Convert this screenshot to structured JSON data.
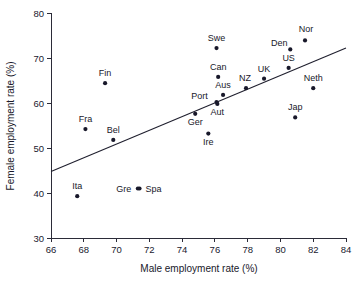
{
  "chart_data": {
    "type": "scatter",
    "title": "",
    "xlabel": "Male employment rate (%)",
    "ylabel": "Female employment rate (%)",
    "xlim": [
      66,
      84
    ],
    "ylim": [
      30,
      80
    ],
    "xticks": [
      66,
      68,
      70,
      72,
      74,
      76,
      78,
      80,
      82,
      84
    ],
    "yticks": [
      30,
      40,
      50,
      60,
      70,
      80
    ],
    "grid": false,
    "legend": null,
    "marker_color": "#18182a",
    "line_color": "#1f1f2e",
    "points": [
      {
        "label": "Ita",
        "x": 67.6,
        "y": 39.3,
        "label_dx": 0,
        "label_dy": -7
      },
      {
        "label": "Fra",
        "x": 68.1,
        "y": 54.2,
        "label_dx": 0,
        "label_dy": -7
      },
      {
        "label": "Fin",
        "x": 69.3,
        "y": 64.4,
        "label_dx": 0,
        "label_dy": -7
      },
      {
        "label": "Bel",
        "x": 69.8,
        "y": 51.8,
        "label_dx": 0,
        "label_dy": -7
      },
      {
        "label": "Gre",
        "x": 71.3,
        "y": 41.0,
        "label_dx": -14,
        "label_dy": 3
      },
      {
        "label": "Spa",
        "x": 71.4,
        "y": 41.0,
        "label_dx": 14,
        "label_dy": 3
      },
      {
        "label": "Ger",
        "x": 74.8,
        "y": 57.6,
        "label_dx": 0,
        "label_dy": 11
      },
      {
        "label": "Ire",
        "x": 75.6,
        "y": 53.2,
        "label_dx": 0,
        "label_dy": 11
      },
      {
        "label": "Swe",
        "x": 76.1,
        "y": 72.2,
        "label_dx": 0,
        "label_dy": -7
      },
      {
        "label": "Can",
        "x": 76.2,
        "y": 65.8,
        "label_dx": 0,
        "label_dy": -7
      },
      {
        "label": "Port",
        "x": 76.1,
        "y": 60.2,
        "label_dx": -17,
        "label_dy": -3
      },
      {
        "label": "Aut",
        "x": 76.15,
        "y": 59.8,
        "label_dx": 0,
        "label_dy": 11
      },
      {
        "label": "Aus",
        "x": 76.5,
        "y": 61.8,
        "label_dx": 0,
        "label_dy": -7
      },
      {
        "label": "NZ",
        "x": 77.9,
        "y": 63.3,
        "label_dx": -1,
        "label_dy": -7
      },
      {
        "label": "UK",
        "x": 79.0,
        "y": 65.4,
        "label_dx": 0,
        "label_dy": -7
      },
      {
        "label": "US",
        "x": 80.5,
        "y": 67.8,
        "label_dx": 0,
        "label_dy": -7
      },
      {
        "label": "Den",
        "x": 80.6,
        "y": 71.9,
        "label_dx": -11,
        "label_dy": -3
      },
      {
        "label": "Jap",
        "x": 80.9,
        "y": 56.8,
        "label_dx": 0,
        "label_dy": -7
      },
      {
        "label": "Nor",
        "x": 81.5,
        "y": 73.9,
        "label_dx": 1,
        "label_dy": -8
      },
      {
        "label": "Neth",
        "x": 82.0,
        "y": 63.3,
        "label_dx": 0,
        "label_dy": -7
      }
    ],
    "fit_line": {
      "x1": 66,
      "y1": 44.8,
      "x2": 84,
      "y2": 72.2
    }
  }
}
